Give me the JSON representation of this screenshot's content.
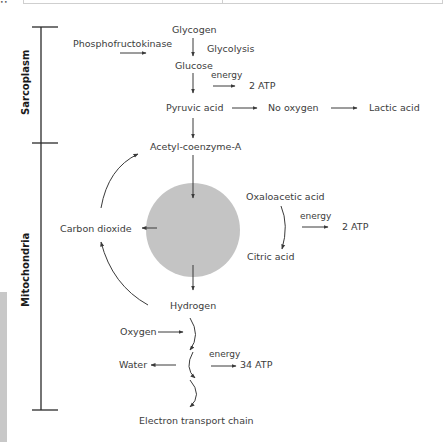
{
  "figure": {
    "regions": {
      "sarcoplasm": "Sarcoplasm",
      "mitochondria": "Mitochondria"
    },
    "nodes": {
      "glycogen": "Glycogen",
      "phosphofructokinase": "Phosphofructokinase",
      "glycolysis": "Glycolysis",
      "glucose": "Glucose",
      "energy_1": "energy",
      "atp_1": "2 ATP",
      "pyruvic_acid": "Pyruvic acid",
      "no_oxygen": "No oxygen",
      "lactic_acid": "Lactic acid",
      "acetyl_coa": "Acetyl-coenzyme-A",
      "carbon_dioxide": "Carbon dioxide",
      "oxaloacetic_acid": "Oxaloacetic acid",
      "energy_2": "energy",
      "atp_2": "2 ATP",
      "citric_acid": "Citric acid",
      "hydrogen": "Hydrogen",
      "oxygen": "Oxygen",
      "water": "Water",
      "energy_3": "energy",
      "atp_3": "34 ATP",
      "electron_transport_chain": "Electron transport chain"
    },
    "colors": {
      "circle": "#c4c4c4",
      "lines": "#3a3a3a",
      "side_bar": "#c8c8c8"
    }
  }
}
